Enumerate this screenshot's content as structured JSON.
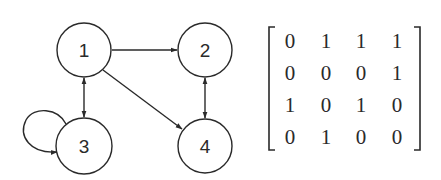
{
  "diagram": {
    "type": "directed-graph-with-adjacency-matrix",
    "colors": {
      "stroke": "#2a2a2a",
      "background": "#ffffff"
    },
    "nodes": [
      {
        "id": "1",
        "label": "1",
        "cx": 84,
        "cy": 50,
        "r": 27
      },
      {
        "id": "2",
        "label": "2",
        "cx": 205,
        "cy": 50,
        "r": 27
      },
      {
        "id": "3",
        "label": "3",
        "cx": 84,
        "cy": 146,
        "r": 28
      },
      {
        "id": "4",
        "label": "4",
        "cx": 205,
        "cy": 146,
        "r": 27
      }
    ],
    "edges": [
      {
        "from": "1",
        "to": "2",
        "direction": "forward"
      },
      {
        "from": "1",
        "to": "3",
        "direction": "bidirectional"
      },
      {
        "from": "1",
        "to": "4",
        "direction": "forward"
      },
      {
        "from": "2",
        "to": "4",
        "direction": "bidirectional"
      },
      {
        "from": "3",
        "to": "3",
        "direction": "self-loop"
      }
    ],
    "matrix": {
      "rows": [
        [
          "0",
          "1",
          "1",
          "1"
        ],
        [
          "0",
          "0",
          "0",
          "1"
        ],
        [
          "1",
          "0",
          "1",
          "0"
        ],
        [
          "0",
          "1",
          "0",
          "0"
        ]
      ]
    }
  }
}
